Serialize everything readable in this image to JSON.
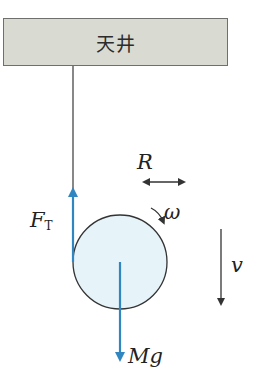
{
  "ceiling": {
    "label": "天井"
  },
  "labels": {
    "radius": "R",
    "angular_velocity": "ω",
    "tension_main": "F",
    "tension_sub": "T",
    "velocity": "v",
    "weight": "Mg"
  },
  "colors": {
    "force_arrow": "#2f86c0",
    "disk_fill": "#e6f3f9",
    "line": "#333333",
    "ceiling_fill": "#d9dbd3"
  }
}
